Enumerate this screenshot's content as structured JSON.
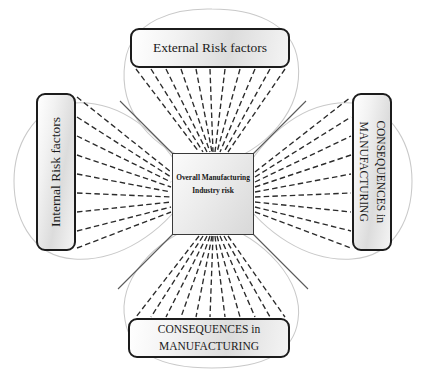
{
  "diagram": {
    "title_text": "Overall Manufacturing Industry risk",
    "center": {
      "line1": "Overall Manufacturing",
      "line2": "Industry risk",
      "shape_name": "hourglass-square"
    },
    "nodes": {
      "top": {
        "label": "External Risk factors",
        "position": "top",
        "orientation": "horizontal"
      },
      "left": {
        "label": "Internal Risk factors",
        "position": "left",
        "orientation": "vertical-bottom-to-top"
      },
      "right": {
        "line1": "CONSEQUENCES in",
        "line2": "MANUFACTURING",
        "position": "right",
        "orientation": "vertical-top-to-bottom"
      },
      "bottom": {
        "line1": "CONSEQUENCES in",
        "line2": "MANUFACTURING",
        "position": "bottom",
        "orientation": "horizontal"
      }
    },
    "connectors": {
      "style": "dashed-fan",
      "top_count": 11,
      "bottom_count": 11,
      "left_count": 9,
      "right_count": 9,
      "dash_color": "#2b2b2b",
      "leaf_outline_color": "#c9c9c9",
      "diagonal_color": "#5a5a5a"
    },
    "colors": {
      "background": "#ffffff",
      "box_border": "#1c1c1c",
      "box_fill_light": "#ffffff",
      "box_fill_shade": "#dcdcdc",
      "text": "#1a1a1a"
    }
  }
}
